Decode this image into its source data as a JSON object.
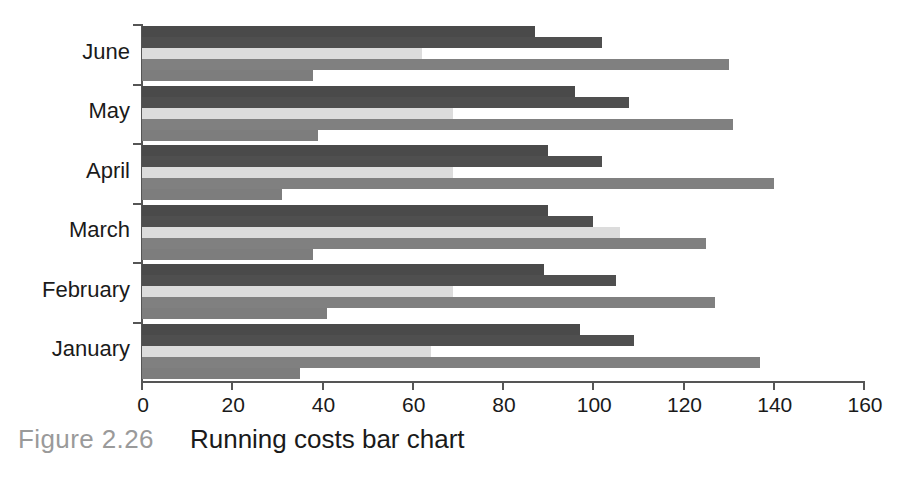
{
  "caption": {
    "figure_number": "Figure 2.26",
    "title": "Running costs bar chart"
  },
  "chart_data": {
    "type": "bar",
    "orientation": "horizontal",
    "title": "Running costs bar chart",
    "xlabel": "",
    "ylabel": "",
    "xlim": [
      0,
      160
    ],
    "xticks": [
      0,
      20,
      40,
      60,
      80,
      100,
      120,
      140,
      160
    ],
    "xtick_labels": [
      "0",
      "20",
      "40",
      "60",
      "80",
      "100",
      "120",
      "140",
      "160"
    ],
    "grid": false,
    "legend": "none",
    "categories": [
      "June",
      "May",
      "April",
      "March",
      "February",
      "January"
    ],
    "series": [
      {
        "name": "Series 1",
        "color": "#4a4a4a",
        "values": [
          87,
          96,
          90,
          90,
          89,
          97
        ]
      },
      {
        "name": "Series 2",
        "color": "#4f4f4f",
        "values": [
          102,
          108,
          102,
          100,
          105,
          109
        ]
      },
      {
        "name": "Series 3",
        "color": "#dcdcdc",
        "values": [
          62,
          69,
          69,
          106,
          69,
          64
        ]
      },
      {
        "name": "Series 4",
        "color": "#808080",
        "values": [
          130,
          131,
          140,
          125,
          127,
          137
        ]
      },
      {
        "name": "Series 5",
        "color": "#7d7d7d",
        "values": [
          38,
          39,
          31,
          38,
          41,
          35
        ]
      }
    ]
  },
  "axis": {
    "px_per_unit": 4.5125,
    "plot_left_px": 142,
    "plot_top_px": 24,
    "plot_height_px": 357
  },
  "colors": {
    "axis": "#555555",
    "text": "#1a1a1a",
    "caption_muted": "#9a9a9a",
    "background": "#ffffff"
  }
}
